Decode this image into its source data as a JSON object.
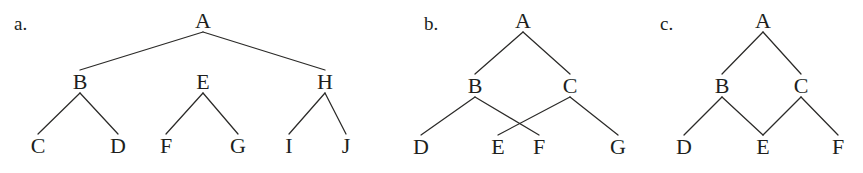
{
  "figure": {
    "width": 863,
    "height": 173,
    "background": "#ffffff",
    "ink_color": "#201f1d",
    "edge_color": "#2b2a28"
  },
  "panels": [
    {
      "id": "panel-a",
      "label": "a.",
      "label_x": 14,
      "label_y": 14,
      "nodes": [
        {
          "id": "A",
          "label": "A",
          "x": 203,
          "y": 21
        },
        {
          "id": "B",
          "label": "B",
          "x": 80,
          "y": 82
        },
        {
          "id": "E",
          "label": "E",
          "x": 203,
          "y": 82
        },
        {
          "id": "H",
          "label": "H",
          "x": 325,
          "y": 82
        },
        {
          "id": "C",
          "label": "C",
          "x": 38,
          "y": 146
        },
        {
          "id": "D",
          "label": "D",
          "x": 118,
          "y": 146
        },
        {
          "id": "F",
          "label": "F",
          "x": 166,
          "y": 146
        },
        {
          "id": "G",
          "label": "G",
          "x": 238,
          "y": 146
        },
        {
          "id": "I",
          "label": "I",
          "x": 289,
          "y": 146
        },
        {
          "id": "J",
          "label": "J",
          "x": 346,
          "y": 146
        }
      ],
      "edges": [
        {
          "from": "A",
          "to": "B"
        },
        {
          "from": "A",
          "to": "H"
        },
        {
          "from": "B",
          "to": "C"
        },
        {
          "from": "B",
          "to": "D"
        },
        {
          "from": "E",
          "to": "F"
        },
        {
          "from": "E",
          "to": "G"
        },
        {
          "from": "H",
          "to": "I"
        },
        {
          "from": "H",
          "to": "J"
        }
      ]
    },
    {
      "id": "panel-b",
      "label": "b.",
      "label_x": 424,
      "label_y": 14,
      "nodes": [
        {
          "id": "A",
          "label": "A",
          "x": 523,
          "y": 21
        },
        {
          "id": "B",
          "label": "B",
          "x": 475,
          "y": 86
        },
        {
          "id": "C",
          "label": "C",
          "x": 570,
          "y": 86
        },
        {
          "id": "D",
          "label": "D",
          "x": 421,
          "y": 147
        },
        {
          "id": "E",
          "label": "E",
          "x": 498,
          "y": 147
        },
        {
          "id": "F",
          "label": "F",
          "x": 539,
          "y": 147
        },
        {
          "id": "G",
          "label": "G",
          "x": 618,
          "y": 147
        }
      ],
      "edges": [
        {
          "from": "A",
          "to": "B"
        },
        {
          "from": "A",
          "to": "C"
        },
        {
          "from": "B",
          "to": "D"
        },
        {
          "from": "B",
          "to": "F"
        },
        {
          "from": "C",
          "to": "E"
        },
        {
          "from": "C",
          "to": "G"
        }
      ]
    },
    {
      "id": "panel-c",
      "label": "c.",
      "label_x": 660,
      "label_y": 14,
      "nodes": [
        {
          "id": "A",
          "label": "A",
          "x": 763,
          "y": 21
        },
        {
          "id": "B",
          "label": "B",
          "x": 722,
          "y": 86
        },
        {
          "id": "C",
          "label": "C",
          "x": 801,
          "y": 86
        },
        {
          "id": "D",
          "label": "D",
          "x": 684,
          "y": 147
        },
        {
          "id": "E",
          "label": "E",
          "x": 763,
          "y": 147
        },
        {
          "id": "F",
          "label": "F",
          "x": 838,
          "y": 147
        }
      ],
      "edges": [
        {
          "from": "A",
          "to": "B"
        },
        {
          "from": "A",
          "to": "C"
        },
        {
          "from": "B",
          "to": "D"
        },
        {
          "from": "B",
          "to": "E"
        },
        {
          "from": "C",
          "to": "E"
        },
        {
          "from": "C",
          "to": "F"
        }
      ]
    }
  ],
  "chart_data": {
    "type": "diagram",
    "subtype": "node-link-tree",
    "title": "",
    "graphs": [
      {
        "name": "a.",
        "is_tree": false,
        "root": "A",
        "nodes": [
          "A",
          "B",
          "C",
          "D",
          "E",
          "F",
          "G",
          "H",
          "I",
          "J"
        ],
        "edges": [
          [
            "A",
            "B"
          ],
          [
            "A",
            "H"
          ],
          [
            "B",
            "C"
          ],
          [
            "B",
            "D"
          ],
          [
            "E",
            "F"
          ],
          [
            "E",
            "G"
          ],
          [
            "H",
            "I"
          ],
          [
            "H",
            "J"
          ]
        ],
        "levels": [
          [
            "A"
          ],
          [
            "B",
            "E",
            "H"
          ],
          [
            "C",
            "D",
            "F",
            "G",
            "I",
            "J"
          ]
        ],
        "note": "Subtree rooted at E is disconnected from A"
      },
      {
        "name": "b.",
        "is_tree": true,
        "root": "A",
        "nodes": [
          "A",
          "B",
          "C",
          "D",
          "E",
          "F",
          "G"
        ],
        "edges": [
          [
            "A",
            "B"
          ],
          [
            "A",
            "C"
          ],
          [
            "B",
            "D"
          ],
          [
            "B",
            "F"
          ],
          [
            "C",
            "E"
          ],
          [
            "C",
            "G"
          ]
        ],
        "levels": [
          [
            "A"
          ],
          [
            "B",
            "C"
          ],
          [
            "D",
            "E",
            "F",
            "G"
          ]
        ],
        "note": "Edges B-F and C-E cross each other visually"
      },
      {
        "name": "c.",
        "is_tree": false,
        "root": "A",
        "nodes": [
          "A",
          "B",
          "C",
          "D",
          "E",
          "F"
        ],
        "edges": [
          [
            "A",
            "B"
          ],
          [
            "A",
            "C"
          ],
          [
            "B",
            "D"
          ],
          [
            "B",
            "E"
          ],
          [
            "C",
            "E"
          ],
          [
            "C",
            "F"
          ]
        ],
        "levels": [
          [
            "A"
          ],
          [
            "B",
            "C"
          ],
          [
            "D",
            "E",
            "F"
          ]
        ],
        "note": "Node E has two parents (B and C)"
      }
    ]
  }
}
